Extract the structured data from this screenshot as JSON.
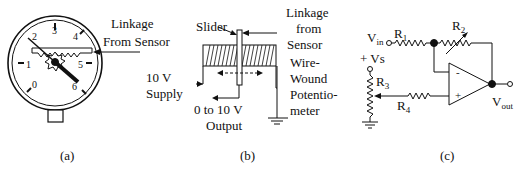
{
  "panels": {
    "a": {
      "caption": "(a)",
      "dial_numbers": [
        "0",
        "1",
        "2",
        "3",
        "4",
        "5",
        "6"
      ],
      "label_linkage": "Linkage",
      "label_from_sensor": "From Sensor"
    },
    "b": {
      "caption": "(b)",
      "label_slider": "Slider",
      "label_linkage": "Linkage",
      "label_from": "from",
      "label_sensor": "Sensor",
      "label_supply_1": "10 V",
      "label_supply_2": "Supply",
      "label_output_1": "0 to 10 V",
      "label_output_2": "Output",
      "label_wire": "Wire-",
      "label_wound": "Wound",
      "label_potentio": "Potentio-",
      "label_meter": "meter"
    },
    "c": {
      "caption": "(c)",
      "vin_main": "V",
      "vin_sub": "in",
      "vs_label": "+ Vs",
      "r1_main": "R",
      "r1_sub": "1",
      "r2_main": "R",
      "r2_sub": "2",
      "r3_main": "R",
      "r3_sub": "3",
      "r4_main": "R",
      "r4_sub": "4",
      "vout_main": "V",
      "vout_sub": "out",
      "minus": "-",
      "plus": "+"
    }
  }
}
